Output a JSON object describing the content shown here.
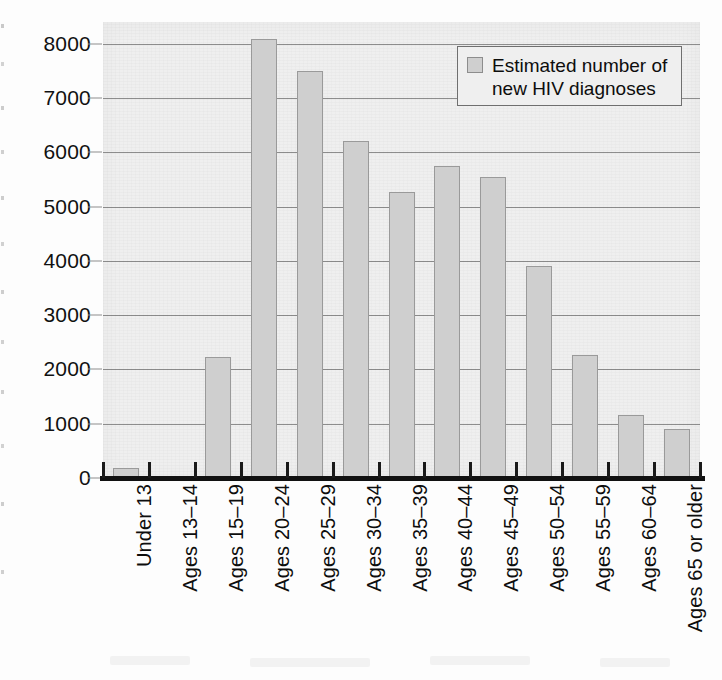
{
  "chart_data": {
    "type": "bar",
    "title": "",
    "subtitle": "",
    "xlabel": "",
    "ylabel": "",
    "ylim": [
      0,
      8400
    ],
    "grid": true,
    "grid_axis": "y",
    "legend_position": "top-right",
    "orientation": "vertical",
    "categories": [
      "Under 13",
      "Ages 13–14",
      "Ages 15–19",
      "Ages 20–24",
      "Ages 25–29",
      "Ages 30–34",
      "Ages 35–39",
      "Ages 40–44",
      "Ages 45–49",
      "Ages 50–54",
      "Ages 55–59",
      "Ages 60–64",
      "Ages 65 or older"
    ],
    "series": [
      {
        "name": "Estimated number of new HIV diagnoses",
        "values": [
          180,
          40,
          2230,
          8080,
          7500,
          6200,
          5270,
          5740,
          5550,
          3910,
          2260,
          1160,
          900
        ]
      }
    ],
    "ytick_values": [
      0,
      1000,
      2000,
      3000,
      4000,
      5000,
      6000,
      7000,
      8000
    ],
    "ytick_labels": [
      "0",
      "1000",
      "2000",
      "3000",
      "4000",
      "5000",
      "6000",
      "7000",
      "8000"
    ],
    "legend": [
      {
        "label": "Estimated number of new HIV diagnoses",
        "color": "#cfcfcf"
      }
    ],
    "colors": {
      "bar_fill": "#cfcfcf",
      "bar_border": "#9a9a9a",
      "plot_background": "#efefef",
      "gridline": "#8d8d8d",
      "axis": "#111111",
      "text": "#0d0d0d"
    }
  },
  "legend_block": {
    "line1": "Estimated number of",
    "line2": "new HIV diagnoses",
    "swatch_name": "legend-swatch"
  }
}
